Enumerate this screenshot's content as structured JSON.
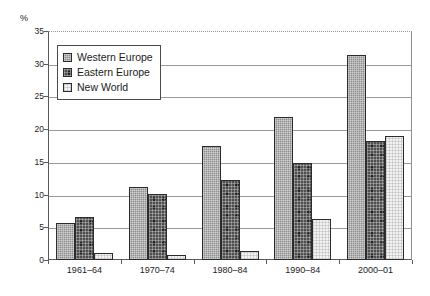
{
  "chart_data": {
    "type": "bar",
    "title": "",
    "subtitle": "",
    "xlabel": "",
    "ylabel": "%",
    "unit_label": "%",
    "categories": [
      "1961–64",
      "1970–74",
      "1980–84",
      "1990–84",
      "2000–01"
    ],
    "series": [
      {
        "name": "Western Europe",
        "values": [
          5.6,
          11.2,
          17.5,
          21.8,
          31.3
        ],
        "color": "#8d8d8d"
      },
      {
        "name": "Eastern Europe",
        "values": [
          6.5,
          10.1,
          12.2,
          14.8,
          18.2
        ],
        "color": "#4f4f4f"
      },
      {
        "name": "New World",
        "values": [
          1.0,
          0.8,
          1.4,
          6.2,
          18.9
        ],
        "color": "#f2f2f2"
      }
    ],
    "ylim": [
      0,
      35
    ],
    "yticks": [
      0,
      5,
      10,
      15,
      20,
      25,
      30,
      35
    ],
    "ytick_labels": [
      "0",
      "5",
      "10",
      "15",
      "20",
      "25",
      "30",
      "35"
    ],
    "grid": true,
    "grid_axis": "y",
    "legend_position": "upper-left-inside",
    "legend_entries": [
      "Western Europe",
      "Eastern Europe",
      "New World"
    ],
    "annotations": []
  },
  "colors": {
    "axis": "#5a5a5a",
    "grid": "#9a9a9a",
    "bar_outline": "#2c2c2c",
    "text": "#1c1c1c",
    "background": "#ffffff",
    "legend_border": "#4a4a4a"
  }
}
